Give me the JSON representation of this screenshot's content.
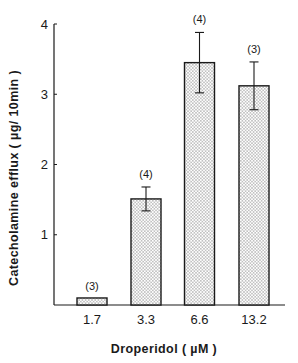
{
  "chart_data": {
    "type": "bar",
    "title": "",
    "xlabel": "Droperidol ( µM )",
    "ylabel": "Catecholamine efflux ( µg/ 10min )",
    "categories": [
      "1.7",
      "3.3",
      "6.6",
      "13.2"
    ],
    "values": [
      0.1,
      1.51,
      3.45,
      3.12
    ],
    "error": [
      0,
      0.17,
      0.43,
      0.34
    ],
    "n_labels": [
      "(3)",
      "(4)",
      "(4)",
      "(3)"
    ],
    "ylim": [
      0,
      4
    ],
    "yticks": [
      1,
      2,
      3,
      4
    ],
    "grid": false,
    "legend": null,
    "bar_fill": "stippled dots",
    "colors": {
      "ink": "#1a1a1a",
      "bar_fill": "#ffffff",
      "dot": "#555555"
    }
  }
}
